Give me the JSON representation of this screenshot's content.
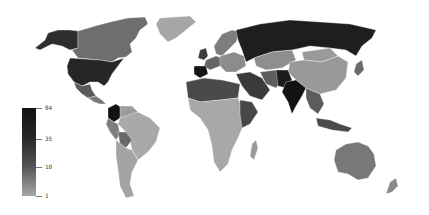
{
  "map": {
    "type": "choropleth",
    "projection": "world",
    "color_scale": "grayscale (light = low, dark = high)",
    "legend": {
      "scale": "logarithmic",
      "ticks": [
        {
          "label": "84",
          "y": 108
        },
        {
          "label": "35",
          "y": 139
        },
        {
          "label": "10",
          "y": 167
        },
        {
          "label": "1",
          "y": 196
        }
      ],
      "min_color": "#a8a8a8",
      "max_color": "#111111"
    },
    "regions": {
      "canada": "#6e6e6e",
      "alaska": "#2e2e2e",
      "usa": "#262626",
      "mexico": "#5a5a5a",
      "central_america": "#7a7a7a",
      "greenland": "#a6a6a6",
      "colombia": "#111111",
      "venezuela": "#9c9c9c",
      "brazil": "#a9a9a9",
      "peru": "#7e7e7e",
      "bolivia": "#686868",
      "argentina_chile": "#a4a4a4",
      "russia": "#1e1e1e",
      "scandinavia": "#7d7d7d",
      "western_europe": "#666666",
      "spain": "#141414",
      "uk": "#3c3c3c",
      "central_europe": "#8c8c8c",
      "kazakhstan": "#8e8e8e",
      "china": "#999999",
      "mongolia": "#9a9a9a",
      "middle_east": "#3a3a3a",
      "iran": "#5e5e5e",
      "pakistan_afghan": "#1c1c1c",
      "india": "#121212",
      "southeast_asia": "#5c5c5c",
      "indonesia": "#4a4a4a",
      "north_africa": "#4a4a4a",
      "africa": "#a8a8a8",
      "east_africa": "#474747",
      "madagascar": "#9a9a9a",
      "australia": "#787878",
      "new_zealand": "#8a8a8a",
      "japan": "#6a6a6a"
    }
  }
}
